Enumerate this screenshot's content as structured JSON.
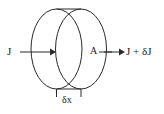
{
  "figure": {
    "type": "physics-diagram",
    "background_color": "#ffffff",
    "stroke_color": "#2b2b2b",
    "text_color": "#1a1a1a",
    "labels": {
      "current_in": "J",
      "area": "A",
      "current_out": "J + δJ",
      "thickness": "δx"
    },
    "geometry": {
      "left_ellipse": {
        "cx": 56.5,
        "cy": 49,
        "rx": 25.5,
        "ry": 40
      },
      "right_ellipse": {
        "cx": 81.0,
        "cy": 49,
        "rx": 25.5,
        "ry": 40
      },
      "top_connector_y": 9,
      "bottom_connector_y": 89,
      "arrow_in": {
        "x1": 20,
        "x2": 52,
        "y": 52
      },
      "arrow_out": {
        "x1": 105,
        "x2": 124,
        "y": 52
      },
      "tick_left_x": 56,
      "tick_right_x": 81,
      "tick_y_top": 89,
      "tick_y_bottom": 96
    }
  }
}
